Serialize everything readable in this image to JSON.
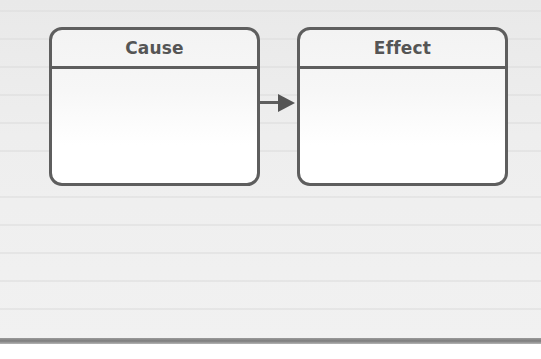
{
  "diagram": {
    "type": "entity-relationship",
    "entities": [
      {
        "id": "cause",
        "title": "Cause"
      },
      {
        "id": "effect",
        "title": "Effect"
      }
    ],
    "relationships": [
      {
        "from": "cause",
        "to": "effect",
        "arrow": "filled-triangle"
      }
    ],
    "colors": {
      "stroke": "#5e5e5e",
      "title_text": "#555555",
      "page_background": "#eeeeee",
      "page_edge": "#7d7d7d"
    }
  }
}
